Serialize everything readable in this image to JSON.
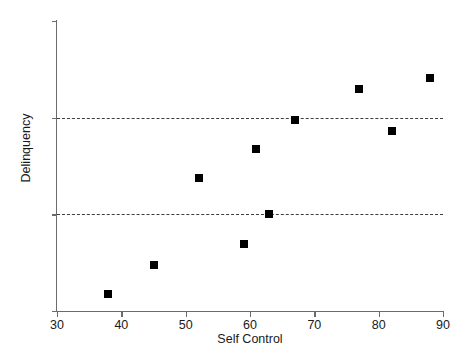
{
  "chart_data": {
    "type": "scatter",
    "title": "",
    "xlabel": "Self Control",
    "ylabel": "Delinquency",
    "xlim": [
      30,
      90
    ],
    "ylim": [
      0,
      30
    ],
    "xticks": [
      30,
      40,
      50,
      60,
      70,
      80,
      90
    ],
    "xtick_labels": [
      "30",
      "40",
      "50",
      "60",
      "70",
      "80",
      "90"
    ],
    "yticks": [
      0,
      10,
      20,
      30
    ],
    "ytick_labels": [
      "0",
      "10",
      "20",
      "30"
    ],
    "grid": false,
    "legend": null,
    "marker_color": "#000000",
    "marker_shape": "square",
    "axis_color": "#6b6b6b",
    "reference_lines": [
      {
        "axis": "y",
        "value": 10,
        "style": "dashed",
        "color": "#3d3d3d"
      },
      {
        "axis": "y",
        "value": 20,
        "style": "dashed",
        "color": "#3d3d3d"
      }
    ],
    "points": [
      {
        "x": 38,
        "y": 1.8
      },
      {
        "x": 45,
        "y": 4.8
      },
      {
        "x": 52,
        "y": 13.8
      },
      {
        "x": 59,
        "y": 6.9
      },
      {
        "x": 61,
        "y": 16.8
      },
      {
        "x": 63,
        "y": 10.0
      },
      {
        "x": 67,
        "y": 19.8
      },
      {
        "x": 77,
        "y": 23.0
      },
      {
        "x": 82,
        "y": 18.6
      },
      {
        "x": 88,
        "y": 24.1
      }
    ],
    "series": [
      {
        "name": "Delinquency vs Self Control",
        "x": [
          38,
          45,
          52,
          59,
          61,
          63,
          67,
          77,
          82,
          88
        ],
        "values": [
          1.8,
          4.8,
          13.8,
          6.9,
          16.8,
          10.0,
          19.8,
          23.0,
          18.6,
          24.1
        ]
      }
    ]
  }
}
